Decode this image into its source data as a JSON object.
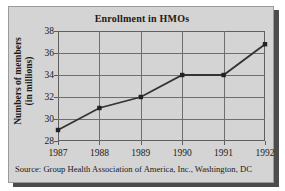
{
  "chart_data": {
    "type": "line",
    "title": "Enrollment in HMOs",
    "xlabel": "",
    "ylabel": "Numbers of members (in millions)",
    "ylabel_lines": [
      "Numbers of members",
      "(in millions)"
    ],
    "categories": [
      "1987",
      "1988",
      "1989",
      "1990",
      "1991",
      "1992"
    ],
    "values": [
      29,
      31,
      32,
      34,
      34,
      36.8
    ],
    "series": [
      {
        "name": "Enrollment in HMOs",
        "values": [
          29,
          31,
          32,
          34,
          34,
          36.8
        ]
      }
    ],
    "ylim": [
      28,
      38
    ],
    "yticks": [
      28,
      30,
      32,
      34,
      36,
      38
    ],
    "ytick_labels": [
      "28",
      "30",
      "32",
      "34",
      "36",
      "38"
    ],
    "xticks": [
      "1987",
      "1988",
      "1989",
      "1990",
      "1991",
      "1992"
    ],
    "grid": true,
    "legend": false,
    "marker": "square",
    "line_color": "#333333",
    "marker_color": "#222222",
    "panel_color": "#d4d4d4",
    "grid_color": "#6e6e6e"
  },
  "source": {
    "text": "Source: Group Health Association of America, Inc., Washington, DC"
  }
}
